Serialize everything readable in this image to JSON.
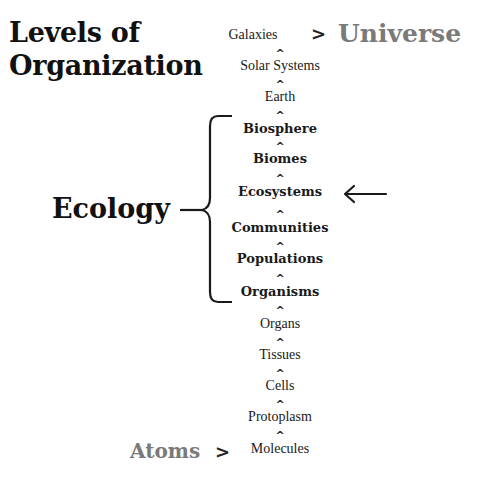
{
  "title": {
    "line1": "Levels of",
    "line2": "Organization"
  },
  "top_label": "Universe",
  "bottom_label": "Atoms",
  "greater_than": ">",
  "caret": "^",
  "ecology_label": "Ecology",
  "levels": [
    {
      "name": "Galaxies",
      "bold": false
    },
    {
      "name": "Solar Systems",
      "bold": false
    },
    {
      "name": "Earth",
      "bold": false
    },
    {
      "name": "Biosphere",
      "bold": true
    },
    {
      "name": "Biomes",
      "bold": true
    },
    {
      "name": "Ecosystems",
      "bold": true
    },
    {
      "name": "Communities",
      "bold": true
    },
    {
      "name": "Populations",
      "bold": true
    },
    {
      "name": "Organisms",
      "bold": true
    },
    {
      "name": "Organs",
      "bold": false
    },
    {
      "name": "Tissues",
      "bold": false
    },
    {
      "name": "Cells",
      "bold": false
    },
    {
      "name": "Protoplasm",
      "bold": false
    },
    {
      "name": "Molecules",
      "bold": false
    }
  ],
  "highlighted_level": "Ecosystems",
  "colors": {
    "text": "#1a1a1a",
    "gray_label": "#7a7a7a"
  }
}
